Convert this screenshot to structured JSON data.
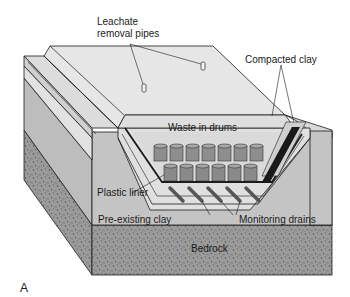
{
  "figure": {
    "panel_label": "A"
  },
  "labels": {
    "leachate_line1": "Leachate",
    "leachate_line2": "removal pipes",
    "compacted_clay": "Compacted clay",
    "waste_in_drums": "Waste in drums",
    "plastic_liner": "Plastic liner",
    "pre_existing_clay": "Pre-existing clay",
    "monitoring_drains": "Monitoring drains",
    "bedrock": "Bedrock"
  },
  "drums": {
    "back_row_count": 7,
    "front_row_count": 6
  },
  "drains": {
    "count": 5
  },
  "colors": {
    "cap_top": "#e6e6e6",
    "cap_side": "#d2d2d2",
    "clay_side": "#bdbdbd",
    "bedrock": "#9a9a9a",
    "drum": "#8e8e8e",
    "outline": "#1a1a1a"
  }
}
